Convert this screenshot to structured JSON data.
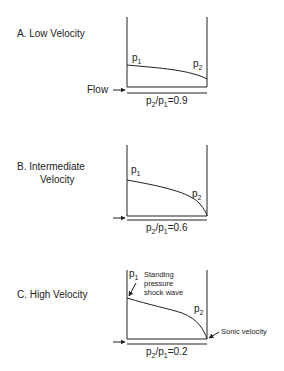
{
  "panels": [
    {
      "title": "A. Low Velocity",
      "p1": "p",
      "p1_sub": "1",
      "p2": "p",
      "p2_sub": "2",
      "flow_label": "Flow",
      "ratio": {
        "prefix": "p",
        "sub2": "2",
        "mid": "/p",
        "sub1": "1",
        "value": "=0.9"
      }
    },
    {
      "title_line1": "B. Intermediate",
      "title_line2": "Velocity",
      "p1": "p",
      "p1_sub": "1",
      "p2": "p",
      "p2_sub": "2",
      "ratio": {
        "prefix": "p",
        "sub2": "2",
        "mid": "/p",
        "sub1": "1",
        "value": "=0.6"
      }
    },
    {
      "title": "C. High Velocity",
      "p1": "p",
      "p1_sub": "1",
      "p2": "p",
      "p2_sub": "2",
      "annotation_shock": [
        "Standing",
        "pressure",
        "shock wave"
      ],
      "annotation_sonic": "Sonic velocity",
      "ratio": {
        "prefix": "p",
        "sub2": "2",
        "mid": "/p",
        "sub1": "1",
        "value": "=0.2"
      }
    }
  ],
  "colors": {
    "line": "#222222",
    "background": "#ffffff"
  }
}
